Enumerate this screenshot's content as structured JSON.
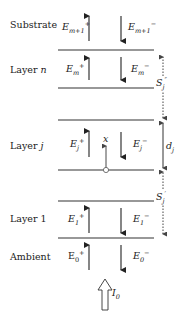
{
  "diagram": {
    "type": "multilayer thin-film field diagram",
    "regions": [
      {
        "label": "Substrate",
        "up_field": {
          "base": "E",
          "sub": "m+1",
          "sup": "+"
        },
        "down_field": {
          "base": "E",
          "sub": "m+1",
          "sup": "−"
        }
      },
      {
        "label": "Layer n",
        "up_field": {
          "base": "E",
          "sub": "m",
          "sup": "+"
        },
        "down_field": {
          "base": "E",
          "sub": "m",
          "sup": "−"
        }
      },
      {
        "label": "Layer j",
        "up_field": {
          "base": "E",
          "sub": "j",
          "sup": "+"
        },
        "down_field": {
          "base": "E",
          "sub": "j",
          "sup": "−"
        }
      },
      {
        "label": "Layer 1",
        "up_field": {
          "base": "E",
          "sub": "1",
          "sup": "+"
        },
        "down_field": {
          "base": "E",
          "sub": "1",
          "sup": "−"
        }
      },
      {
        "label": "Ambient",
        "up_field": {
          "base": "E",
          "sub": "0",
          "sup": "+"
        },
        "down_field": {
          "base": "E",
          "sub": "0",
          "sup": "−"
        }
      }
    ],
    "position_label": "x",
    "thickness_label": {
      "base": "d",
      "sub": "j"
    },
    "upper_matrix_label": {
      "base": "S",
      "sub": "j",
      "sup": "″"
    },
    "lower_matrix_label": {
      "base": "S",
      "sub": "j",
      "sup": "′"
    },
    "incident_label": {
      "base": "I",
      "sub": "0"
    }
  }
}
